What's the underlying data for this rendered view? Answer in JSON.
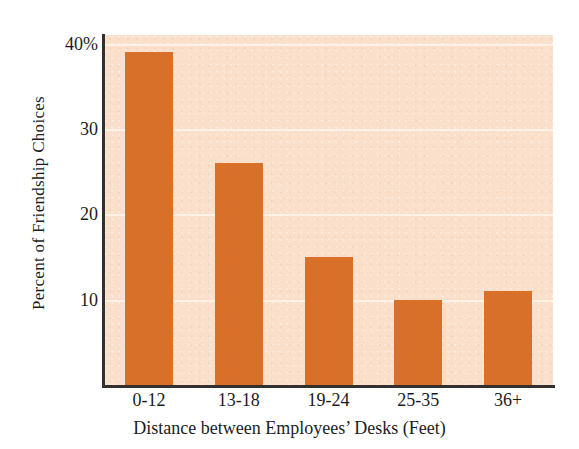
{
  "chart_data": {
    "type": "bar",
    "title": "",
    "categories": [
      "0-12",
      "13-18",
      "19-24",
      "25-35",
      "36+"
    ],
    "values": [
      39,
      26,
      15,
      10,
      11
    ],
    "xlabel": "Distance between Employees’ Desks (Feet)",
    "ylabel": "Percent of Friendship Choices",
    "ylim": [
      0,
      41
    ],
    "yticks": [
      10,
      20,
      30,
      40
    ],
    "ytick_labels": [
      "10",
      "20",
      "30",
      "40%"
    ],
    "grid": "horizontal",
    "legend": "none",
    "colors": {
      "bar": "#d9702a",
      "plot_background": "#fadfcb",
      "gridline": "#fdf2e8",
      "axis": "#33302e",
      "text": "#1c1c1c",
      "page_background": "#ffffff"
    }
  }
}
